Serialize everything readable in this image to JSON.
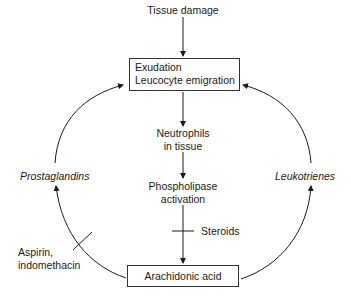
{
  "diagram": {
    "nodes": {
      "tissue_damage": "Tissue damage",
      "exudation_box": {
        "line1": "Exudation",
        "line2": "Leucocyte emigration"
      },
      "neutrophils": {
        "line1": "Neutrophils",
        "line2": "in tissue"
      },
      "phospholipase": {
        "line1": "Phospholipase",
        "line2": "activation"
      },
      "arachidonic_acid": "Arachidonic acid",
      "prostaglandins": "Prostaglandins",
      "leukotrienes": "Leukotrienes"
    },
    "inhibitors": {
      "steroids": "Steroids",
      "nsaids": {
        "line1": "Aspirin,",
        "line2": "indomethacin"
      }
    },
    "edges": [
      {
        "from": "Tissue damage",
        "to": "Exudation / Leucocyte emigration"
      },
      {
        "from": "Exudation / Leucocyte emigration",
        "to": "Neutrophils in tissue"
      },
      {
        "from": "Neutrophils in tissue",
        "to": "Phospholipase activation"
      },
      {
        "from": "Phospholipase activation",
        "to": "Arachidonic acid",
        "blocked_by": "Steroids"
      },
      {
        "from": "Arachidonic acid",
        "to": "Prostaglandins",
        "blocked_by": "Aspirin, indomethacin"
      },
      {
        "from": "Prostaglandins",
        "to": "Exudation / Leucocyte emigration"
      },
      {
        "from": "Arachidonic acid",
        "to": "Leukotrienes"
      },
      {
        "from": "Leukotrienes",
        "to": "Exudation / Leucocyte emigration"
      }
    ]
  }
}
